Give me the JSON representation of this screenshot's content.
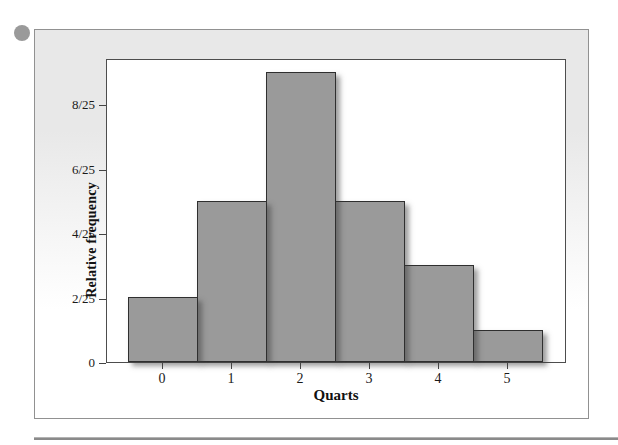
{
  "figure": {
    "bullet_icon": "circle-bullet",
    "panel_background_top": "#e8e8e8",
    "panel_background_bottom": "#ffffff",
    "panel_border": "#919191",
    "rule_color": "#8a8a8a"
  },
  "chart_data": {
    "type": "bar",
    "subtype": "relative-frequency-histogram",
    "title": "",
    "xlabel": "Quarts",
    "ylabel": "Relative frequency",
    "categories": [
      "0",
      "1",
      "2",
      "3",
      "4",
      "5"
    ],
    "counts": [
      2,
      5,
      9,
      5,
      3,
      1
    ],
    "total": 25,
    "values": [
      0.08,
      0.2,
      0.36,
      0.2,
      0.12,
      0.04
    ],
    "values_fraction": [
      "2/25",
      "5/25",
      "9/25",
      "5/25",
      "3/25",
      "1/25"
    ],
    "yticks": [
      {
        "value": 0,
        "label": "0"
      },
      {
        "value": 2,
        "label": "2/25"
      },
      {
        "value": 4,
        "label": "4/25"
      },
      {
        "value": 6,
        "label": "6/25"
      },
      {
        "value": 8,
        "label": "8/25"
      }
    ],
    "ylim_units_of_25ths": [
      0,
      9.4
    ],
    "grid": false,
    "legend": "none",
    "bar_fill": "#9a9a9a",
    "bar_border": "#2f2f2f"
  }
}
